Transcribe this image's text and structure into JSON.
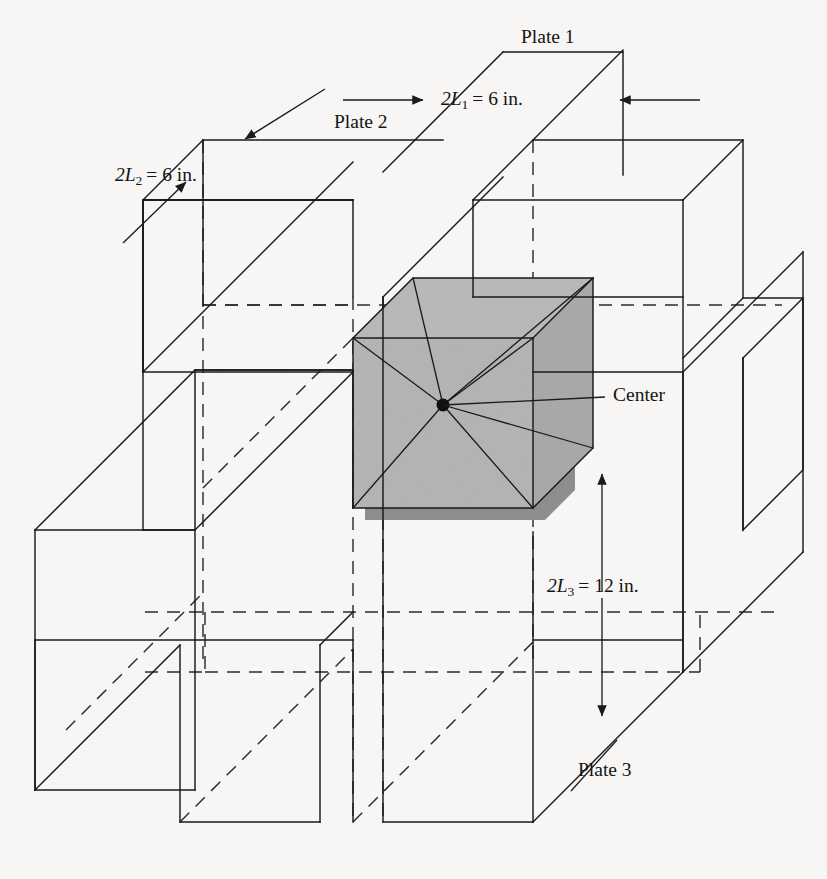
{
  "figure": {
    "kind": "isometric-engineering-diagram",
    "background_color": "#f7f6f4",
    "line_color": "#1a1a1a",
    "core_fill_color": "#b3b3b3",
    "core_shadow_color": "#8a8a8a",
    "labels": {
      "plate1": "Plate 1",
      "plate2": "Plate 2",
      "plate3": "Plate 3",
      "center": "Center"
    },
    "dimensions": [
      {
        "id": "dim-2l1",
        "symbol": "2L",
        "subscript": "1",
        "equals": "=",
        "value": "6",
        "unit": "in.",
        "full_text": "2L1 = 6 in.",
        "applies_to": "Plate 1",
        "orientation": "horizontal"
      },
      {
        "id": "dim-2l2",
        "symbol": "2L",
        "subscript": "2",
        "equals": "=",
        "value": "6",
        "unit": "in.",
        "full_text": "2L2 = 6 in.",
        "applies_to": "Plate 2",
        "orientation": "oblique"
      },
      {
        "id": "dim-2l3",
        "symbol": "2L",
        "subscript": "3",
        "equals": "=",
        "value": "12",
        "unit": "in.",
        "full_text": "2L3 = 12 in.",
        "applies_to": "Plate 3",
        "orientation": "vertical"
      }
    ]
  },
  "chart_data": {
    "type": "diagram",
    "geometry": {
      "projection": "oblique / cabinet, depth axis at 45 degrees up-right",
      "plate_thicknesses_in": {
        "2L1": 6,
        "2L2": 6,
        "2L3": 12
      },
      "core_block_in": {
        "x": 6,
        "y": 6,
        "z": 12
      },
      "center_point_label": "Center",
      "rays_from_center": 6
    }
  }
}
